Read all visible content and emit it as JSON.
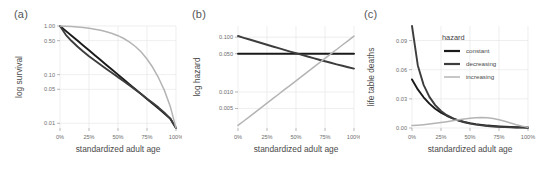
{
  "figure": {
    "panels": [
      {
        "label": "(a)",
        "ylabel": "log survival",
        "xlabel": "standardized adult age",
        "yticks": [
          "1.00",
          "0.50",
          "0.10",
          "0.05",
          "0.01"
        ],
        "xticks": [
          "0%",
          "25%",
          "50%",
          "75%",
          "100%"
        ]
      },
      {
        "label": "(b)",
        "ylabel": "log hazard",
        "xlabel": "standardized adult age",
        "yticks": [
          "0.100",
          "0.050",
          "0.010",
          "0.005"
        ],
        "xticks": [
          "0%",
          "25%",
          "50%",
          "75%",
          "100%"
        ]
      },
      {
        "label": "(c)",
        "ylabel": "life table deaths",
        "xlabel": "standardized adult age",
        "yticks": [
          "0.09",
          "0.06",
          "0.03",
          "0.00"
        ],
        "xticks": [
          "0%",
          "25%",
          "50%",
          "75%",
          "100%"
        ]
      }
    ],
    "legend": {
      "title": "hazard",
      "items": [
        {
          "label": "constant",
          "color": "#1a1a1a"
        },
        {
          "label": "decreasing",
          "color": "#3d3d3d"
        },
        {
          "label": "increasing",
          "color": "#b4b4b4"
        }
      ]
    },
    "colors": {
      "constant": "#1a1a1a",
      "decreasing": "#3d3d3d",
      "increasing": "#b4b4b4",
      "grid": "#e6e6e6",
      "background": "#ffffff"
    }
  },
  "chart_data": [
    {
      "type": "line",
      "panel": "(a)",
      "title": "",
      "xlabel": "standardized adult age",
      "ylabel": "log survival",
      "yscale": "log",
      "ylim": [
        0.008,
        1.0
      ],
      "xlim": [
        0,
        100
      ],
      "grid": true,
      "ytick_values": [
        1.0,
        0.5,
        0.1,
        0.05,
        0.01
      ],
      "xtick_values": [
        0,
        25,
        50,
        75,
        100
      ],
      "x": [
        0,
        5,
        10,
        15,
        20,
        25,
        30,
        35,
        40,
        45,
        50,
        55,
        60,
        65,
        70,
        75,
        80,
        85,
        90,
        95,
        100
      ],
      "series": [
        {
          "name": "constant",
          "color": "#1a1a1a",
          "values": [
            1.0,
            0.794,
            0.631,
            0.501,
            0.398,
            0.316,
            0.251,
            0.2,
            0.158,
            0.126,
            0.1,
            0.0794,
            0.0631,
            0.0501,
            0.0398,
            0.0316,
            0.0251,
            0.02,
            0.0158,
            0.0126,
            0.008
          ]
        },
        {
          "name": "decreasing",
          "color": "#3d3d3d",
          "values": [
            1.0,
            0.66,
            0.49,
            0.38,
            0.3,
            0.24,
            0.195,
            0.16,
            0.131,
            0.108,
            0.089,
            0.073,
            0.06,
            0.049,
            0.04,
            0.032,
            0.026,
            0.021,
            0.0165,
            0.0125,
            0.008
          ]
        },
        {
          "name": "increasing",
          "color": "#b4b4b4",
          "values": [
            1.0,
            0.988,
            0.972,
            0.953,
            0.928,
            0.898,
            0.861,
            0.817,
            0.764,
            0.703,
            0.632,
            0.553,
            0.468,
            0.379,
            0.291,
            0.21,
            0.14,
            0.0855,
            0.0475,
            0.0225,
            0.008
          ]
        }
      ]
    },
    {
      "type": "line",
      "panel": "(b)",
      "title": "",
      "xlabel": "standardized adult age",
      "ylabel": "log hazard",
      "yscale": "log",
      "ylim": [
        0.0022,
        0.16
      ],
      "xlim": [
        0,
        100
      ],
      "grid": true,
      "ytick_values": [
        0.1,
        0.05,
        0.01,
        0.005
      ],
      "xtick_values": [
        0,
        25,
        50,
        75,
        100
      ],
      "x": [
        0,
        5,
        10,
        15,
        20,
        25,
        30,
        35,
        40,
        45,
        50,
        55,
        60,
        65,
        70,
        75,
        80,
        85,
        90,
        95,
        100
      ],
      "series": [
        {
          "name": "constant",
          "color": "#1a1a1a",
          "values": [
            0.05,
            0.05,
            0.05,
            0.05,
            0.05,
            0.05,
            0.05,
            0.05,
            0.05,
            0.05,
            0.05,
            0.05,
            0.05,
            0.05,
            0.05,
            0.05,
            0.05,
            0.05,
            0.05,
            0.05,
            0.05
          ]
        },
        {
          "name": "decreasing",
          "color": "#3d3d3d",
          "values": [
            0.105,
            0.0975,
            0.0906,
            0.0842,
            0.0783,
            0.0728,
            0.0677,
            0.063,
            0.0587,
            0.0547,
            0.051,
            0.0476,
            0.0444,
            0.0415,
            0.0388,
            0.0364,
            0.0341,
            0.032,
            0.0301,
            0.0283,
            0.0267
          ]
        },
        {
          "name": "increasing",
          "color": "#b4b4b4",
          "values": [
            0.00245,
            0.00295,
            0.00356,
            0.0043,
            0.00518,
            0.00625,
            0.00754,
            0.0091,
            0.011,
            0.01325,
            0.016,
            0.0193,
            0.0233,
            0.0281,
            0.0339,
            0.0409,
            0.0494,
            0.0596,
            0.0719,
            0.0868,
            0.1047
          ]
        }
      ]
    },
    {
      "type": "line",
      "panel": "(c)",
      "title": "",
      "xlabel": "standardized adult age",
      "ylabel": "life table deaths",
      "yscale": "linear",
      "ylim": [
        0,
        0.105
      ],
      "xlim": [
        0,
        100
      ],
      "grid": true,
      "ytick_values": [
        0.09,
        0.06,
        0.03,
        0.0
      ],
      "xtick_values": [
        0,
        25,
        50,
        75,
        100
      ],
      "x": [
        0,
        5,
        10,
        15,
        20,
        25,
        30,
        35,
        40,
        45,
        50,
        55,
        60,
        65,
        70,
        75,
        80,
        85,
        90,
        95,
        100
      ],
      "series": [
        {
          "name": "constant",
          "color": "#1a1a1a",
          "values": [
            0.05,
            0.0397,
            0.0316,
            0.0251,
            0.0199,
            0.0158,
            0.0126,
            0.01,
            0.0079,
            0.0063,
            0.005,
            0.004,
            0.0032,
            0.0025,
            0.002,
            0.0016,
            0.0013,
            0.001,
            0.0008,
            0.0006,
            0.0005
          ]
        },
        {
          "name": "decreasing",
          "color": "#3d3d3d",
          "values": [
            0.105,
            0.0644,
            0.0444,
            0.032,
            0.0235,
            0.0175,
            0.0132,
            0.0101,
            0.0077,
            0.0059,
            0.0045,
            0.0035,
            0.0027,
            0.002,
            0.0016,
            0.0012,
            0.0009,
            0.0007,
            0.0005,
            0.0004,
            0.0003
          ]
        },
        {
          "name": "increasing",
          "color": "#b4b4b4",
          "values": [
            0.00245,
            0.00291,
            0.00346,
            0.0041,
            0.00481,
            0.00561,
            0.00649,
            0.00743,
            0.0084,
            0.00932,
            0.01011,
            0.01067,
            0.0109,
            0.01065,
            0.00986,
            0.00859,
            0.00692,
            0.00509,
            0.0034,
            0.00193,
            0.0008
          ]
        }
      ]
    }
  ]
}
